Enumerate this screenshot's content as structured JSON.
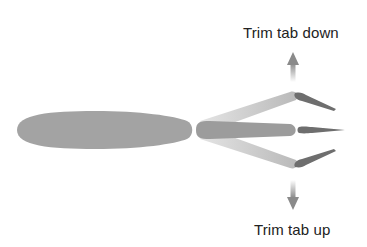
{
  "labels": {
    "top": "Trim tab down",
    "bottom": "Trim tab up"
  },
  "colors": {
    "background": "#ffffff",
    "airfoil": "#a3a3a3",
    "elevator": "#9c9c9c",
    "elevator_deflected": "#bdbdbd",
    "trim_tab": "#6e6e6e",
    "arrow": "#8a8a8a",
    "text": "#222222"
  },
  "parts": [
    {
      "name": "horizontal-stabilizer",
      "description": "main airfoil section"
    },
    {
      "name": "elevator",
      "positions": [
        "up",
        "neutral",
        "down"
      ]
    },
    {
      "name": "trim-tab",
      "positions": [
        "deflected-down (elevator up)",
        "neutral",
        "deflected-up (elevator down)"
      ]
    }
  ]
}
